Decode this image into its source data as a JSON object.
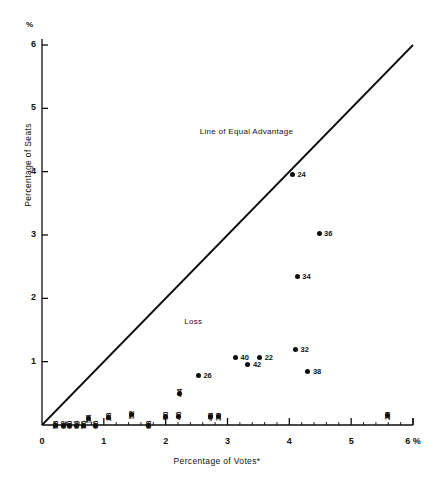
{
  "chart_data": {
    "type": "scatter",
    "title": "",
    "xlabel": "Percentage of Votes*",
    "ylabel": "Percentage of Seats",
    "x_unit_label": "6 %",
    "y_unit_label": "%",
    "xlim": [
      0,
      6
    ],
    "ylim": [
      0,
      6
    ],
    "xticks": [
      "0",
      "1",
      "2",
      "3",
      "4",
      "5",
      "6"
    ],
    "yticks": [
      "1",
      "2",
      "3",
      "4",
      "5",
      "6"
    ],
    "grid": false,
    "legend": "none",
    "annotations": [
      {
        "text": "Line of Equal Advantage",
        "x": 2.55,
        "y": 4.62
      },
      {
        "text": "Loss",
        "x": 2.3,
        "y": 1.62
      }
    ],
    "reference_line": {
      "name": "Line of Equal Advantage",
      "from": [
        0,
        0
      ],
      "to": [
        6,
        6
      ]
    },
    "points": [
      {
        "label": "58",
        "x": 0.22,
        "y": 0.0,
        "rot": true
      },
      {
        "label": "62",
        "x": 0.34,
        "y": 0.0,
        "rot": true
      },
      {
        "label": "60",
        "x": 0.45,
        "y": 0.0,
        "rot": true
      },
      {
        "label": "64",
        "x": 0.56,
        "y": 0.0,
        "rot": true
      },
      {
        "label": "56",
        "x": 0.67,
        "y": 0.0,
        "rot": true
      },
      {
        "label": "54",
        "x": 0.75,
        "y": 0.1,
        "rot": true
      },
      {
        "label": "66",
        "x": 0.87,
        "y": 0.0,
        "rot": true
      },
      {
        "label": "28",
        "x": 1.07,
        "y": 0.12,
        "rot": true
      },
      {
        "label": "52",
        "x": 1.45,
        "y": 0.16,
        "rot": true
      },
      {
        "label": "68",
        "x": 1.72,
        "y": 0.0,
        "rot": true
      },
      {
        "label": "50",
        "x": 2.0,
        "y": 0.14,
        "rot": true
      },
      {
        "label": "46",
        "x": 2.2,
        "y": 0.14,
        "rot": true
      },
      {
        "label": "44",
        "x": 2.22,
        "y": 0.5,
        "rot": true
      },
      {
        "label": "26",
        "x": 2.53,
        "y": 0.78,
        "rot": false
      },
      {
        "label": "48",
        "x": 2.72,
        "y": 0.13,
        "rot": true
      },
      {
        "label": "30",
        "x": 2.85,
        "y": 0.13,
        "rot": true
      },
      {
        "label": "40",
        "x": 3.13,
        "y": 1.06,
        "rot": false
      },
      {
        "label": "42",
        "x": 3.33,
        "y": 0.95,
        "rot": false
      },
      {
        "label": "22",
        "x": 3.52,
        "y": 1.06,
        "rot": false
      },
      {
        "label": "32",
        "x": 4.1,
        "y": 1.2,
        "rot": false
      },
      {
        "label": "24",
        "x": 4.05,
        "y": 3.95,
        "rot": false
      },
      {
        "label": "34",
        "x": 4.13,
        "y": 2.35,
        "rot": false
      },
      {
        "label": "36",
        "x": 4.48,
        "y": 3.02,
        "rot": false
      },
      {
        "label": "38",
        "x": 4.3,
        "y": 0.85,
        "rot": false
      },
      {
        "label": "20",
        "x": 5.58,
        "y": 0.15,
        "rot": true
      }
    ]
  },
  "axes": {
    "y_top_symbol": "%",
    "x_end_symbol": "6 %"
  },
  "colors": {
    "ink": "#0d0d0d",
    "background": "#ffffff"
  }
}
